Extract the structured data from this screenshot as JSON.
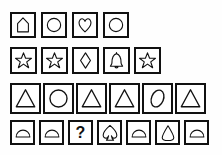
{
  "puzzle": {
    "title": "shape-matrix-puzzle",
    "colors": {
      "background": "#fefefe",
      "cell_border": "#111111",
      "shape_stroke": "#111111",
      "shape_fill": "#ffffff"
    },
    "missing_marker": "?",
    "rows": [
      {
        "index": 0,
        "cells": [
          {
            "shape": "pentagon-house",
            "label": "house"
          },
          {
            "shape": "circle",
            "label": "circle"
          },
          {
            "shape": "heart",
            "label": "heart"
          },
          {
            "shape": "circle",
            "label": "circle"
          }
        ]
      },
      {
        "index": 1,
        "cells": [
          {
            "shape": "star",
            "label": "star"
          },
          {
            "shape": "star",
            "label": "star"
          },
          {
            "shape": "diamond",
            "label": "diamond"
          },
          {
            "shape": "bell",
            "label": "bell"
          },
          {
            "shape": "star",
            "label": "star"
          }
        ]
      },
      {
        "index": 2,
        "cells": [
          {
            "shape": "triangle",
            "label": "triangle"
          },
          {
            "shape": "circle",
            "label": "circle"
          },
          {
            "shape": "triangle",
            "label": "triangle"
          },
          {
            "shape": "triangle",
            "label": "triangle"
          },
          {
            "shape": "ellipse-tilted",
            "label": "ellipse"
          },
          {
            "shape": "triangle",
            "label": "triangle"
          }
        ]
      },
      {
        "index": 3,
        "cells": [
          {
            "shape": "dome",
            "label": "dome"
          },
          {
            "shape": "dome",
            "label": "dome"
          },
          {
            "shape": "question",
            "label": "question-mark"
          },
          {
            "shape": "spade",
            "label": "spade"
          },
          {
            "shape": "dome",
            "label": "dome"
          },
          {
            "shape": "teardrop",
            "label": "teardrop"
          },
          {
            "shape": "dome",
            "label": "dome"
          }
        ]
      }
    ]
  }
}
